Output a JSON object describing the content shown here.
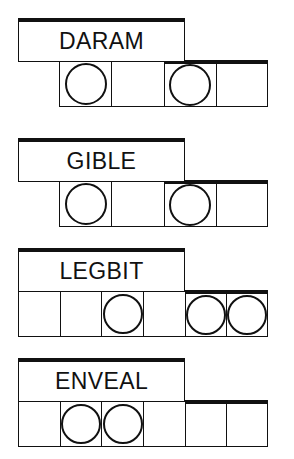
{
  "canvas": {
    "width": 294,
    "height": 459,
    "background": "#ffffff",
    "ink": "#111111"
  },
  "puzzles": [
    {
      "id": "puzzle-daram",
      "label": "DARAM",
      "label_box": {
        "x": 18,
        "y": 18,
        "width": 167,
        "height": 44
      },
      "strip": {
        "x": 59,
        "y": 60,
        "width": 209,
        "height": 47,
        "cells": 4
      },
      "circles": [
        1,
        3
      ],
      "exposed_from_cell": 3,
      "circle_diameter": 42
    },
    {
      "id": "puzzle-gible",
      "label": "GIBLE",
      "label_box": {
        "x": 18,
        "y": 138,
        "width": 167,
        "height": 44
      },
      "strip": {
        "x": 59,
        "y": 180,
        "width": 209,
        "height": 47,
        "cells": 4
      },
      "circles": [
        1,
        3
      ],
      "exposed_from_cell": 3,
      "circle_diameter": 42
    },
    {
      "id": "puzzle-legbit",
      "label": "LEGBIT",
      "label_box": {
        "x": 18,
        "y": 248,
        "width": 167,
        "height": 44
      },
      "strip": {
        "x": 18,
        "y": 290,
        "width": 250,
        "height": 47,
        "cells": 6
      },
      "circles": [
        3,
        5,
        6
      ],
      "exposed_from_cell": 5,
      "circle_diameter": 40
    },
    {
      "id": "puzzle-enveal",
      "label": "ENVEAL",
      "label_box": {
        "x": 18,
        "y": 358,
        "width": 167,
        "height": 44
      },
      "strip": {
        "x": 18,
        "y": 400,
        "width": 250,
        "height": 47,
        "cells": 6
      },
      "circles": [
        2,
        3
      ],
      "exposed_from_cell": 5,
      "circle_diameter": 40
    }
  ]
}
